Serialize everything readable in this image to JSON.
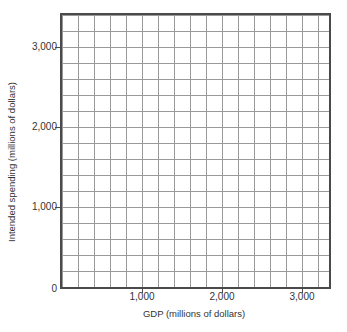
{
  "chart_data": {
    "type": "line",
    "title": "",
    "xlabel": "GDP (millions of dollars)",
    "ylabel": "Intended spending (millions of dollars)",
    "x_ticks": [
      "1,000",
      "2,000",
      "3,000"
    ],
    "y_ticks": [
      "0",
      "1,000",
      "2,000",
      "3,000"
    ],
    "xlim": [
      0,
      3340
    ],
    "ylim": [
      0,
      3400
    ],
    "grid": true,
    "grid_spacing_units": 200,
    "legend_position": "none",
    "series": [],
    "annotations": "Empty coordinate grid with no data series plotted"
  },
  "colors": {
    "background": "#ffffff",
    "axis_border": "#4a4a4a",
    "gridline": "#999999",
    "text": "#333333"
  }
}
